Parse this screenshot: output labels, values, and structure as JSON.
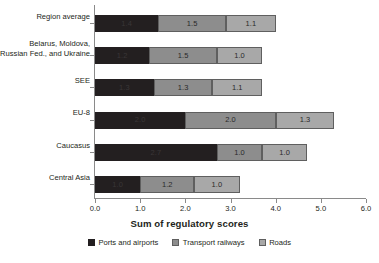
{
  "chart_data": {
    "type": "bar",
    "orientation": "horizontal",
    "stacked": true,
    "title": "",
    "xlabel": "Sum of regulatory scores",
    "ylabel": "",
    "xlim": [
      0.0,
      6.0
    ],
    "xticks": [
      "0.0",
      "1.0",
      "2.0",
      "3.0",
      "4.0",
      "5.0",
      "6.0"
    ],
    "grid": false,
    "legend_position": "bottom",
    "categories": [
      "Region average",
      "Belarus, Moldova,\nRussian Fed., and Ukraine",
      "SEE",
      "EU-8",
      "Caucasus",
      "Central Asia"
    ],
    "series": [
      {
        "name": "Ports and airports",
        "color": "#231f20",
        "values": [
          1.4,
          1.2,
          1.3,
          2.0,
          2.7,
          1.0
        ],
        "labels": [
          "1.4",
          "1.2",
          "1.3",
          "2.0",
          "2.7",
          "1.0"
        ]
      },
      {
        "name": "Transport railways",
        "color": "#8d8d8d",
        "values": [
          1.5,
          1.5,
          1.3,
          2.0,
          1.0,
          1.2
        ],
        "labels": [
          "1.5",
          "1.5",
          "1.3",
          "2.0",
          "1.0",
          "1.2"
        ]
      },
      {
        "name": "Roads",
        "color": "#a8a8a8",
        "values": [
          1.1,
          1.0,
          1.1,
          1.3,
          1.0,
          1.0
        ],
        "labels": [
          "1.1",
          "1.0",
          "1.1",
          "1.3",
          "1.0",
          "1.0"
        ]
      }
    ],
    "totals": [
      4.0,
      3.7,
      3.7,
      5.3,
      4.7,
      3.2
    ]
  },
  "axis_title": "Sum of regulatory scores",
  "legend": {
    "items": [
      {
        "label": "Ports and airports"
      },
      {
        "label": "Transport railways"
      },
      {
        "label": "Roads"
      }
    ]
  },
  "categories": [
    {
      "line1": "Region average",
      "line2": ""
    },
    {
      "line1": "Belarus, Moldova,",
      "line2": "Russian Fed., and Ukraine"
    },
    {
      "line1": "SEE",
      "line2": ""
    },
    {
      "line1": "EU-8",
      "line2": ""
    },
    {
      "line1": "Caucasus",
      "line2": ""
    },
    {
      "line1": "Central Asia",
      "line2": ""
    }
  ]
}
